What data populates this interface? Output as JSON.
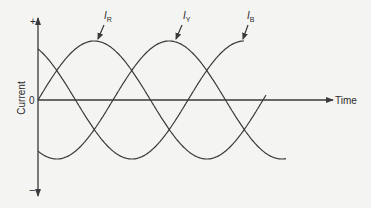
{
  "figure": {
    "type": "three-phase current waveform",
    "y_axis": {
      "label": "Current",
      "plus": "+",
      "minus": "−",
      "origin": "0"
    },
    "x_axis": {
      "label": "Time"
    },
    "series": [
      {
        "id": "IR",
        "main": "I",
        "sub": "R",
        "phase_deg": 0
      },
      {
        "id": "IY",
        "main": "I",
        "sub": "Y",
        "phase_deg": -120
      },
      {
        "id": "IB",
        "main": "I",
        "sub": "B",
        "phase_deg": 120
      }
    ],
    "colors": {
      "line": "#3a3a3a",
      "background": "#f4f4f2"
    }
  }
}
